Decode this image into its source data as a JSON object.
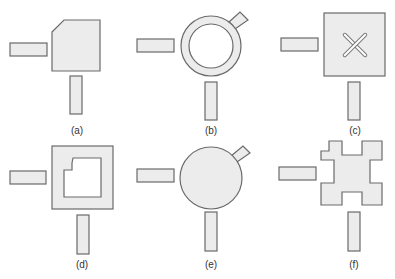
{
  "figure": {
    "colors": {
      "fill": "#ececec",
      "stroke": "#6a6a6a",
      "background": "#ffffff",
      "text": "#333333"
    },
    "panels": [
      {
        "id": "a",
        "label": "(a)",
        "label_pos": [
          77,
          134
        ],
        "patch": {
          "type": "polygon",
          "points": "52,32 64,20 100,20 100,71 52,71"
        },
        "feed_h": [
          10,
          43,
          37,
          13
        ],
        "feed_v": [
          70,
          76,
          12,
          38
        ]
      },
      {
        "id": "b",
        "label": "(b)",
        "label_pos": [
          211,
          134
        ],
        "patch": {
          "type": "ring",
          "cx": 211,
          "cy": 46,
          "r_outer": 30,
          "r_inner": 22,
          "stub": "229,22 240,12 248,20 235,29"
        },
        "feed_h": [
          137,
          39,
          37,
          13
        ],
        "feed_v": [
          205,
          82,
          12,
          38
        ]
      },
      {
        "id": "c",
        "label": "(c)",
        "label_pos": [
          355,
          134
        ],
        "patch": {
          "type": "square-x-slot",
          "x": 324,
          "y": 13,
          "w": 61,
          "h": 63,
          "cx": 355,
          "cy": 45,
          "arm": 16,
          "slot_w": 3
        },
        "feed_h": [
          281,
          38,
          37,
          13
        ],
        "feed_v": [
          348,
          82,
          12,
          38
        ]
      },
      {
        "id": "d",
        "label": "(d)",
        "label_pos": [
          82,
          268
        ],
        "patch": {
          "type": "square-hole",
          "outer": [
            52,
            146,
            61,
            63
          ],
          "hole_points": "64,170 72,170 72,163 73,158 101,158 101,197 64,197"
        },
        "feed_h": [
          10,
          171,
          36,
          13
        ],
        "feed_v": [
          77,
          215,
          12,
          39
        ]
      },
      {
        "id": "e",
        "label": "(e)",
        "label_pos": [
          211,
          268
        ],
        "patch": {
          "type": "disc",
          "cx": 211,
          "cy": 178,
          "r": 31,
          "stub": "231,156 243,146 250,153 237,162"
        },
        "feed_h": [
          137,
          169,
          37,
          13
        ],
        "feed_v": [
          205,
          212,
          12,
          39
        ]
      },
      {
        "id": "f",
        "label": "(f)",
        "label_pos": [
          354,
          268
        ],
        "patch": {
          "type": "polygon",
          "points": "329,141 342,141 342,155 362,155 362,141 382,141 382,160 370,160 370,183 382,183 382,205 362,205 362,192 342,192 342,205 321,205 321,183 334,183 334,160 321,160 321,151 329,151"
        },
        "feed_h": [
          279,
          167,
          37,
          13
        ],
        "feed_v": [
          348,
          212,
          12,
          39
        ]
      }
    ]
  }
}
